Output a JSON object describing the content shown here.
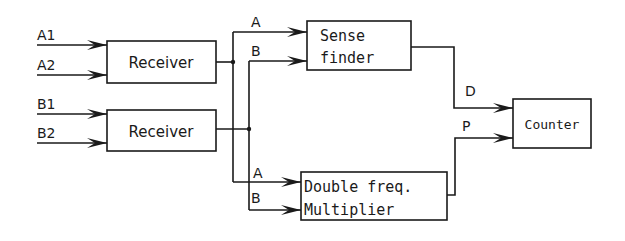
{
  "diagram": {
    "blocks": {
      "receiver1": {
        "label": "Receiver"
      },
      "receiver2": {
        "label": "Receiver"
      },
      "sense_finder": {
        "line1": "Sense",
        "line2": "finder"
      },
      "double_freq": {
        "line1": "Double freq.",
        "line2": "Multiplier"
      },
      "counter": {
        "label": "Counter"
      }
    },
    "inputs": {
      "a1": "A1",
      "a2": "A2",
      "b1": "B1",
      "b2": "B2"
    },
    "signals": {
      "sense_a": "A",
      "sense_b": "B",
      "mult_a": "A",
      "mult_b": "B",
      "d": "D",
      "p": "P"
    },
    "colors": {
      "line": "#1a1a1a",
      "background": "#ffffff"
    }
  }
}
